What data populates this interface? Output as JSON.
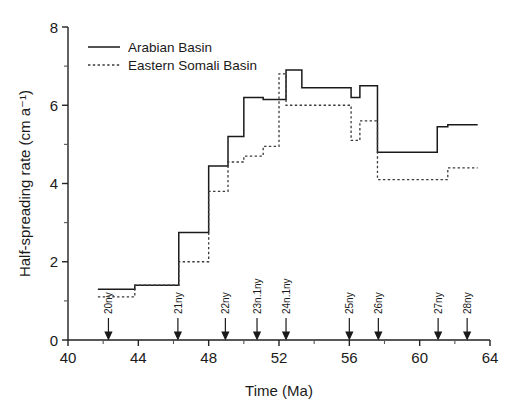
{
  "chart_data": {
    "type": "line",
    "subtype": "step",
    "title": "",
    "xlabel": "Time (Ma)",
    "ylabel": "Half-spreading rate (cm a⁻¹)",
    "xlim": [
      40,
      64
    ],
    "ylim": [
      0,
      8
    ],
    "xticks": [
      40,
      44,
      48,
      52,
      56,
      60,
      64
    ],
    "xticklabels": [
      "40",
      "44",
      "48",
      "52",
      "56",
      "60",
      "64"
    ],
    "xminorticks": [
      42,
      46,
      50,
      54,
      58,
      62
    ],
    "yticks": [
      0,
      2,
      4,
      6,
      8
    ],
    "yticklabels": [
      "0",
      "2",
      "4",
      "6",
      "8"
    ],
    "yminorticks": [
      1,
      3,
      5,
      7
    ],
    "grid": false,
    "legend_position": "upper-left",
    "series": [
      {
        "name": "Arabian Basin",
        "style": "solid",
        "color": "#1a1a1a",
        "steps": [
          {
            "x0": 41.7,
            "x1": 43.8,
            "y": 1.3
          },
          {
            "x0": 43.8,
            "x1": 46.3,
            "y": 1.4
          },
          {
            "x0": 46.3,
            "x1": 48.0,
            "y": 2.75
          },
          {
            "x0": 48.0,
            "x1": 49.1,
            "y": 4.45
          },
          {
            "x0": 49.1,
            "x1": 50.0,
            "y": 5.2
          },
          {
            "x0": 50.0,
            "x1": 51.1,
            "y": 6.2
          },
          {
            "x0": 51.1,
            "x1": 52.4,
            "y": 6.15
          },
          {
            "x0": 52.4,
            "x1": 53.3,
            "y": 6.9
          },
          {
            "x0": 53.3,
            "x1": 56.1,
            "y": 6.45
          },
          {
            "x0": 56.1,
            "x1": 56.6,
            "y": 6.2
          },
          {
            "x0": 56.6,
            "x1": 57.6,
            "y": 6.5
          },
          {
            "x0": 57.6,
            "x1": 61.0,
            "y": 4.8
          },
          {
            "x0": 61.0,
            "x1": 61.6,
            "y": 5.45
          },
          {
            "x0": 61.6,
            "x1": 63.3,
            "y": 5.5
          }
        ]
      },
      {
        "name": "Eastern Somali Basin",
        "style": "dashed",
        "color": "#3a3a3a",
        "steps": [
          {
            "x0": 41.7,
            "x1": 43.8,
            "y": 1.1
          },
          {
            "x0": 43.8,
            "x1": 46.3,
            "y": 1.4
          },
          {
            "x0": 46.3,
            "x1": 48.0,
            "y": 2.0
          },
          {
            "x0": 48.0,
            "x1": 49.1,
            "y": 3.8
          },
          {
            "x0": 49.1,
            "x1": 50.0,
            "y": 4.55
          },
          {
            "x0": 50.0,
            "x1": 51.1,
            "y": 4.7
          },
          {
            "x0": 51.1,
            "x1": 52.0,
            "y": 4.95
          },
          {
            "x0": 52.0,
            "x1": 52.4,
            "y": 6.8
          },
          {
            "x0": 52.4,
            "x1": 56.1,
            "y": 6.0
          },
          {
            "x0": 56.1,
            "x1": 56.6,
            "y": 5.1
          },
          {
            "x0": 56.6,
            "x1": 57.6,
            "y": 5.6
          },
          {
            "x0": 57.6,
            "x1": 61.6,
            "y": 4.1
          },
          {
            "x0": 61.6,
            "x1": 63.3,
            "y": 4.4
          }
        ]
      }
    ],
    "annotations": [
      {
        "label": "20ny",
        "x": 42.3
      },
      {
        "label": "21ny",
        "x": 46.25
      },
      {
        "label": "22ny",
        "x": 48.95
      },
      {
        "label": "23n.1ny",
        "x": 50.75
      },
      {
        "label": "24n.1ny",
        "x": 52.4
      },
      {
        "label": "25ny",
        "x": 56.0
      },
      {
        "label": "26ny",
        "x": 57.65
      },
      {
        "label": "27ny",
        "x": 61.05
      },
      {
        "label": "28ny",
        "x": 62.7
      }
    ]
  },
  "legend": {
    "items": [
      {
        "label": "Arabian Basin",
        "style": "solid"
      },
      {
        "label": "Eastern Somali Basin",
        "style": "dashed"
      }
    ]
  },
  "axes": {
    "x_title": "Time (Ma)",
    "y_title": "Half-spreading rate (cm a⁻¹)"
  }
}
